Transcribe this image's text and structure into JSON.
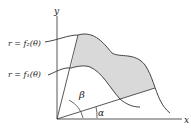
{
  "diagram": {
    "title": "",
    "axes": {
      "x_label": "x",
      "y_label": "y"
    },
    "curves": [
      {
        "name": "outer",
        "label": "r = f₂(θ)"
      },
      {
        "name": "inner",
        "label": "r = f₁(θ)"
      }
    ],
    "angles": {
      "lower": "α",
      "upper": "β"
    },
    "colors": {
      "shade": "#d9d9d9",
      "stroke": "#444444",
      "text": "#222222"
    }
  }
}
